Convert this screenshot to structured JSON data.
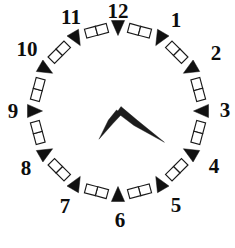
{
  "clock": {
    "title": "Analog clock",
    "face_shape": "dodecagon",
    "center": {
      "x": 118,
      "y": 111
    },
    "radius": 86,
    "rim_style": "chain-of-squares",
    "colors": {
      "background": "#ffffff",
      "outline": "#1a1a1a",
      "marker": "#111111",
      "hand": "#1c1c1c",
      "label": "#0d0d0d"
    },
    "hour_labels": [
      {
        "value": "12",
        "angle_deg": 0,
        "x": 118,
        "y": 13
      },
      {
        "value": "1",
        "angle_deg": 30,
        "x": 176,
        "y": 22
      },
      {
        "value": "2",
        "angle_deg": 60,
        "x": 216,
        "y": 55
      },
      {
        "value": "3",
        "angle_deg": 90,
        "x": 225,
        "y": 112
      },
      {
        "value": "4",
        "angle_deg": 120,
        "x": 214,
        "y": 168
      },
      {
        "value": "5",
        "angle_deg": 150,
        "x": 176,
        "y": 207
      },
      {
        "value": "6",
        "angle_deg": 180,
        "x": 120,
        "y": 222
      },
      {
        "value": "7",
        "angle_deg": 210,
        "x": 65,
        "y": 208
      },
      {
        "value": "8",
        "angle_deg": 240,
        "x": 26,
        "y": 170
      },
      {
        "value": "9",
        "angle_deg": 270,
        "x": 13,
        "y": 113
      },
      {
        "value": "10",
        "angle_deg": 300,
        "x": 27,
        "y": 51
      },
      {
        "value": "11",
        "angle_deg": 330,
        "x": 71,
        "y": 19
      }
    ],
    "hands": {
      "hour": {
        "label": "hour hand",
        "points_to": "7",
        "angle_deg": 214,
        "length": 34,
        "tip": {
          "x": 100,
          "y": 138
        }
      },
      "minute": {
        "label": "minute hand",
        "points_to": "21",
        "angle_deg": 124,
        "length": 56,
        "tip": {
          "x": 168,
          "y": 158
        }
      }
    },
    "reading": "7:21"
  }
}
